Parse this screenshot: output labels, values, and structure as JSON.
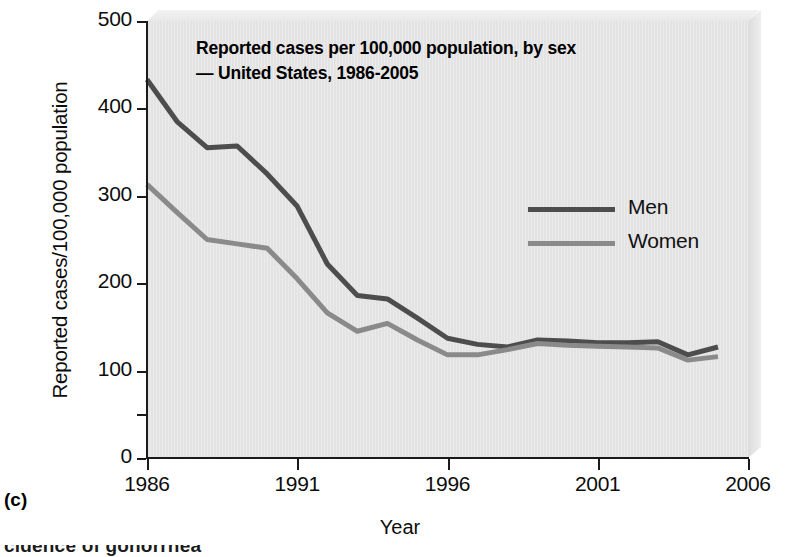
{
  "panel": {
    "letter": "(c)",
    "cut_caption": "cidence of gonorrhea"
  },
  "chart_data": {
    "type": "line",
    "title": "Reported cases per 100,000 population, by sex\n— United States, 1986-2005",
    "title_line1": "Reported cases per 100,000 population, by sex",
    "title_line2": "— United States, 1986-2005",
    "xlabel": "Year",
    "ylabel": "Reported cases/100,000 population",
    "xlim": [
      1986,
      2006
    ],
    "ylim": [
      0,
      500
    ],
    "xticks": [
      1986,
      1991,
      1996,
      2001,
      2006
    ],
    "xtick_labels": [
      "1986",
      "1991",
      "1996",
      "2001",
      "2006"
    ],
    "yticks": [
      0,
      100,
      200,
      300,
      400,
      500
    ],
    "ytick_labels": [
      "0",
      "100",
      "200",
      "300",
      "400",
      "500"
    ],
    "y_minor_ticks": [
      50
    ],
    "grid": false,
    "legend_position": "upper right",
    "x": [
      1986,
      1987,
      1988,
      1989,
      1990,
      1991,
      1992,
      1993,
      1994,
      1995,
      1996,
      1997,
      1998,
      1999,
      2000,
      2001,
      2002,
      2003,
      2004,
      2005
    ],
    "series": [
      {
        "name": "Men",
        "color": "#4d4d4d",
        "values": [
          433,
          385,
          355,
          357,
          325,
          288,
          222,
          186,
          182,
          160,
          137,
          130,
          127,
          135,
          134,
          132,
          132,
          133,
          118,
          127
        ]
      },
      {
        "name": "Women",
        "color": "#8a8a8a",
        "values": [
          313,
          281,
          250,
          245,
          240,
          205,
          166,
          145,
          154,
          135,
          118,
          118,
          124,
          131,
          129,
          128,
          127,
          126,
          112,
          116
        ]
      }
    ]
  },
  "colors": {
    "men": "#4d4d4d",
    "women": "#8a8a8a",
    "plot_background": "#e3e3e3",
    "axis": "#1a1a1a",
    "text": "#0d0d0d"
  }
}
